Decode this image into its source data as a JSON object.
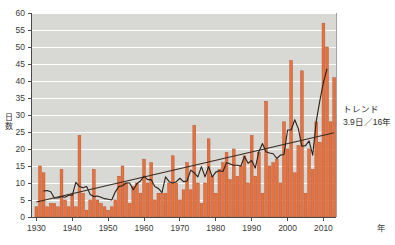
{
  "chart_data": {
    "type": "bar",
    "title": "",
    "subtitle": "",
    "xlabel": "年",
    "ylabel": "日数",
    "xlim": [
      1929.0,
      2014.0
    ],
    "ylim": [
      0,
      60
    ],
    "ytick_step": 5,
    "grid": true,
    "grid_color": "#ffffff",
    "plot_bg": "#d8d8d4",
    "bar_color": "#e8723f",
    "bar_edge_color": "#b3502a",
    "line_color": "#2a2018",
    "trend_color": "#3a2a1e",
    "xticks": [
      1930,
      1940,
      1950,
      1960,
      1970,
      1980,
      1990,
      2000,
      2010
    ],
    "xtick_labels": [
      "1930",
      "1940",
      "1950",
      "1960",
      "1970",
      "1980",
      "1990",
      "2000",
      "2010"
    ],
    "yticks": [
      0,
      5,
      10,
      15,
      20,
      25,
      30,
      35,
      40,
      45,
      50,
      55,
      60
    ],
    "ytick_labels": [
      "0",
      "5",
      "10",
      "15",
      "20",
      "25",
      "30",
      "35",
      "40",
      "45",
      "50",
      "55",
      "60"
    ],
    "series": [
      {
        "name": "日数",
        "type": "bar",
        "x": [
          1930,
          1931,
          1932,
          1933,
          1934,
          1935,
          1936,
          1937,
          1938,
          1939,
          1940,
          1941,
          1942,
          1943,
          1944,
          1945,
          1946,
          1947,
          1948,
          1949,
          1950,
          1951,
          1952,
          1953,
          1954,
          1955,
          1956,
          1957,
          1958,
          1959,
          1960,
          1961,
          1962,
          1963,
          1964,
          1965,
          1966,
          1967,
          1968,
          1969,
          1970,
          1971,
          1972,
          1973,
          1974,
          1975,
          1976,
          1977,
          1978,
          1979,
          1980,
          1981,
          1982,
          1983,
          1984,
          1985,
          1986,
          1987,
          1988,
          1989,
          1990,
          1991,
          1992,
          1993,
          1994,
          1995,
          1996,
          1997,
          1998,
          1999,
          2000,
          2001,
          2002,
          2003,
          2004,
          2005,
          2006,
          2007,
          2008,
          2009,
          2010,
          2011,
          2012,
          2013
        ],
        "values": [
          3,
          15,
          13,
          3,
          4,
          4,
          3,
          14,
          5,
          3,
          7,
          3,
          24,
          7,
          2,
          5,
          14,
          5,
          4,
          3,
          2,
          3,
          5,
          12,
          15,
          10,
          4,
          9,
          10,
          7,
          17,
          10,
          16,
          5,
          7,
          7,
          7,
          10,
          18,
          10,
          5,
          8,
          16,
          8,
          27,
          10,
          4,
          10,
          23,
          12,
          7,
          14,
          16,
          19,
          11,
          20,
          12,
          15,
          18,
          10,
          24,
          12,
          19,
          7,
          34,
          15,
          16,
          17,
          10,
          28,
          20,
          46,
          13,
          21,
          43,
          7,
          20,
          14,
          28,
          22,
          57,
          50,
          28,
          41
        ]
      },
      {
        "name": "5年移動平均",
        "type": "line",
        "x": [
          1932,
          1933,
          1934,
          1935,
          1936,
          1937,
          1938,
          1939,
          1940,
          1941,
          1942,
          1943,
          1944,
          1945,
          1946,
          1947,
          1948,
          1949,
          1950,
          1951,
          1952,
          1953,
          1954,
          1955,
          1956,
          1957,
          1958,
          1959,
          1960,
          1961,
          1962,
          1963,
          1964,
          1965,
          1966,
          1967,
          1968,
          1969,
          1970,
          1971,
          1972,
          1973,
          1974,
          1975,
          1976,
          1977,
          1978,
          1979,
          1980,
          1981,
          1982,
          1983,
          1984,
          1985,
          1986,
          1987,
          1988,
          1989,
          1990,
          1991,
          1992,
          1993,
          1994,
          1995,
          1996,
          1997,
          1998,
          1999,
          2000,
          2001,
          2002,
          2003,
          2004,
          2005,
          2006,
          2007,
          2008,
          2009,
          2010,
          2011
        ],
        "values": [
          7.6,
          7.8,
          7.4,
          5.6,
          5.6,
          6.0,
          5.8,
          6.4,
          6.4,
          10.2,
          9.0,
          8.6,
          9.0,
          6.6,
          6.0,
          6.2,
          5.8,
          5.4,
          5.2,
          5.0,
          7.4,
          9.0,
          9.2,
          10.0,
          10.0,
          8.0,
          9.8,
          10.6,
          12.0,
          11.0,
          11.0,
          9.0,
          8.4,
          7.2,
          11.8,
          10.4,
          10.0,
          10.4,
          11.4,
          10.4,
          10.6,
          13.8,
          13.0,
          11.8,
          14.8,
          11.8,
          14.8,
          11.8,
          13.2,
          13.6,
          13.4,
          16.0,
          15.6,
          15.2,
          15.2,
          15.0,
          17.8,
          15.8,
          16.6,
          14.4,
          19.2,
          21.6,
          19.2,
          18.8,
          18.6,
          17.2,
          18.2,
          18.4,
          25.6,
          25.6,
          28.6,
          26.0,
          20.8,
          21.0,
          22.4,
          18.2,
          28.2,
          34.2,
          39.6,
          43.6
        ]
      },
      {
        "name": "トレンド",
        "type": "line",
        "x": [
          1930,
          2013
        ],
        "values": [
          4.4,
          24.8
        ]
      }
    ],
    "annotations": [
      {
        "name": "trend-label",
        "line1": "トレンド",
        "line2": "3.9日／16年"
      }
    ]
  },
  "legend": {
    "trend_title": "トレンド",
    "trend_value": "3.9日／16年"
  },
  "axes": {
    "y_axis_title": "日数",
    "x_axis_unit": "年"
  }
}
